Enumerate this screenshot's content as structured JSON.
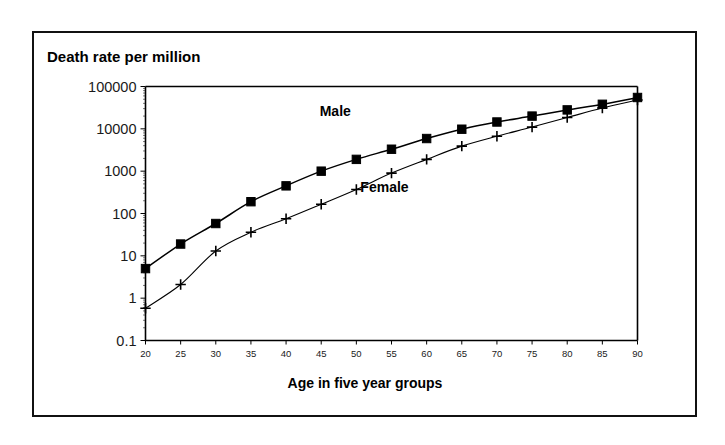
{
  "figure": {
    "title": "Death rate per million",
    "background_color": "#ffffff",
    "border_color": "#111111",
    "ink_color": "#000000"
  },
  "chart_data": {
    "type": "line",
    "title": "Death rate per million",
    "xlabel": "Age in five year groups",
    "ylabel": "Death rate per million",
    "yscale": "log",
    "ylim": [
      0.1,
      100000
    ],
    "xlim": [
      20,
      90
    ],
    "grid": false,
    "legend_position": "inline-annotation",
    "x": [
      20,
      25,
      30,
      35,
      40,
      45,
      50,
      55,
      60,
      65,
      70,
      75,
      80,
      85,
      90
    ],
    "xtick_labels": [
      "20",
      "25",
      "30",
      "35",
      "40",
      "45",
      "50",
      "55",
      "60",
      "65",
      "70",
      "75",
      "80",
      "85",
      "90"
    ],
    "ytick_labels": [
      "0.1",
      "1",
      "10",
      "100",
      "1000",
      "10000",
      "100000"
    ],
    "ytick_values": [
      0.1,
      1,
      10,
      100,
      1000,
      10000,
      100000
    ],
    "series": [
      {
        "name": "Male",
        "marker": "square",
        "label_x": 47,
        "label_y": 20000,
        "values": [
          5,
          19,
          58,
          190,
          450,
          1000,
          1900,
          3300,
          5900,
          9800,
          14500,
          20000,
          28000,
          38000,
          55000
        ]
      },
      {
        "name": "Female",
        "marker": "plus",
        "label_x": 54,
        "label_y": 330,
        "values": [
          0.58,
          2.1,
          13,
          36,
          75,
          165,
          370,
          900,
          1900,
          3900,
          6700,
          11000,
          18500,
          31000,
          48000
        ]
      }
    ]
  }
}
